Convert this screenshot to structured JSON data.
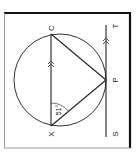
{
  "diagram": {
    "type": "geometry-circle-tangent",
    "rotation_deg": -90,
    "points": {
      "C": {
        "label": "C",
        "x": 51,
        "y": 34
      },
      "X": {
        "label": "X",
        "x": 51,
        "y": 126
      },
      "P": {
        "label": "P",
        "x": 106,
        "y": 80
      },
      "S": {
        "label": "S",
        "x": 106,
        "y": 137
      },
      "T": {
        "label": "T",
        "x": 106,
        "y": 25
      }
    },
    "circle": {
      "cx": 60,
      "cy": 80,
      "r": 46
    },
    "angle": {
      "at": "X",
      "between": [
        "C",
        "P"
      ],
      "label": "51°"
    },
    "parallel_marks": [
      "XC",
      "ST"
    ],
    "tangent_line": "ST",
    "tangent_point": "P",
    "colors": {
      "stroke": "#222222",
      "frame_dark": "#111111",
      "frame_light": "#9a9a9a"
    }
  }
}
